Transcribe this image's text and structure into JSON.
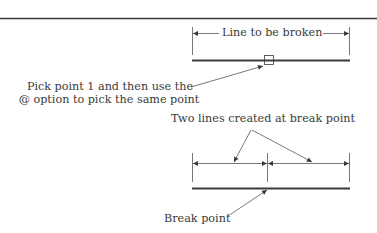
{
  "diagram": {
    "top_section": {
      "dimension_label": "Line to be broken",
      "callout_line1": "Pick point 1 and then use the",
      "callout_line2": "@ option to pick the same point"
    },
    "bottom_section": {
      "callout_label": "Two lines created at break point",
      "break_label": "Break point"
    },
    "colors": {
      "line": "#3a3a3a",
      "thin": "#555555",
      "background": "#ffffff"
    }
  }
}
